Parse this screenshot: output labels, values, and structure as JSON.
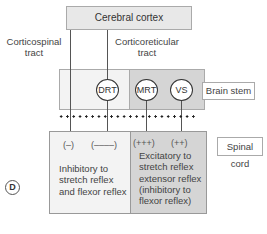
{
  "diagram": {
    "panel_label": "D",
    "cortex": {
      "label": "Cerebral cortex"
    },
    "tracts": {
      "corticospinal": "Corticospinal\ntract",
      "corticospinal_line1": "Corticospinal",
      "corticospinal_line2": "tract",
      "corticoreticular_line1": "Corticoreticular",
      "corticoreticular_line2": "tract"
    },
    "brain_stem": {
      "label": "Brain stem",
      "nuclei": [
        {
          "label": "DRT"
        },
        {
          "label": "MRT"
        },
        {
          "label": "VS"
        }
      ]
    },
    "spinal_cord": {
      "label": "Spinal cord",
      "effects": [
        {
          "symbol": "(–)"
        },
        {
          "symbol": "(––––)"
        },
        {
          "symbol": "(+++)"
        },
        {
          "symbol": "(++)"
        }
      ],
      "left_text": [
        "Inhibitory to",
        "stretch reflex",
        "and flexor reflex"
      ],
      "right_text": [
        "Excitatory to",
        "stretch reflex",
        "extensor reflex",
        "(inhibitory to",
        "flexor reflex)"
      ]
    },
    "colors": {
      "light_region": "#f3f3f3",
      "dark_region": "#d5d5d5",
      "cortex_fill": "#e8e8e8",
      "line": "#555555"
    }
  }
}
